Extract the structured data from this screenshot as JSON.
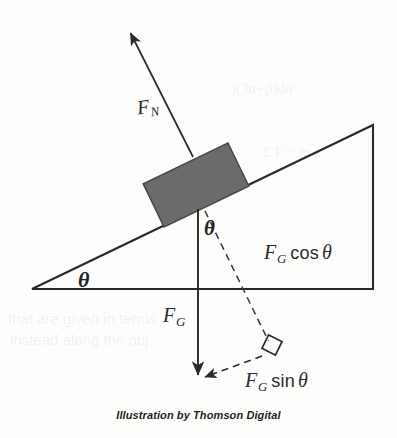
{
  "figure": {
    "caption": "Illustration by Thomson Digital",
    "background_color": "#fdfdfc",
    "stroke_color": "#2a2a2a",
    "block_fill_color": "#6b6b6b",
    "block_stroke_color": "#4a4a4a",
    "labels": {
      "normal_force": {
        "symbol": "F",
        "subscript": "N",
        "full": "F_N"
      },
      "gravity_force": {
        "symbol": "F",
        "subscript": "G",
        "full": "F_G"
      },
      "gravity_cos": {
        "symbol": "F",
        "subscript": "G",
        "operator": "cos",
        "angle": "θ",
        "full": "F_G cos θ"
      },
      "gravity_sin": {
        "symbol": "F",
        "subscript": "G",
        "operator": "sin",
        "angle": "θ",
        "full": "F_G sin θ"
      },
      "incline_angle": "θ",
      "block_angle": "θ"
    },
    "elements": [
      {
        "name": "incline-triangle",
        "type": "right-triangle",
        "vertices": [
          [
            32,
            289
          ],
          [
            373,
            289
          ],
          [
            373,
            125
          ]
        ]
      },
      {
        "name": "block",
        "type": "parallelogram-rotated",
        "angle_deg": 26
      },
      {
        "name": "normal-force-arrow",
        "type": "arrow",
        "from": [
          193,
          155
        ],
        "to": [
          129,
          30
        ]
      },
      {
        "name": "gravity-force-arrow",
        "type": "arrow",
        "from": [
          198,
          210
        ],
        "to": [
          198,
          380
        ]
      },
      {
        "name": "gravity-cos-dashed",
        "type": "dashed-line",
        "from": [
          205,
          210
        ],
        "to": [
          270,
          344
        ]
      },
      {
        "name": "gravity-sin-dashed-arrow",
        "type": "dashed-arrow",
        "from": [
          268,
          350
        ],
        "to": [
          200,
          378
        ]
      },
      {
        "name": "right-angle-marker",
        "type": "square-marker",
        "at": [
          272,
          345
        ]
      }
    ],
    "bleed_through": [
      {
        "text": "∫(3α+β)dα",
        "x": 232,
        "y": 88
      },
      {
        "text": "Σ F = m a",
        "x": 262,
        "y": 152
      },
      {
        "text": "that are given in terms",
        "x": 8,
        "y": 318
      },
      {
        "text": "instead along the obj",
        "x": 10,
        "y": 339
      }
    ]
  }
}
